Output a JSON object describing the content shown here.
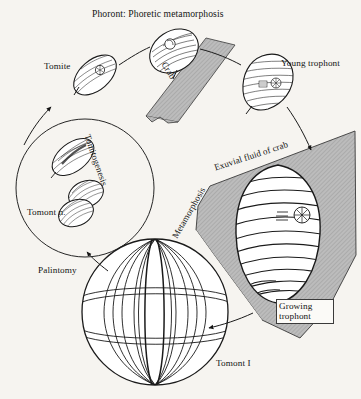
{
  "figure": {
    "kind": "life-cycle-diagram",
    "background_color": "#f6f4f0",
    "ink_color": "#141414",
    "shaded_fill_color": "#b8b8b8",
    "highlight_fill_color": "#ffffff"
  },
  "labels": {
    "title": "Phoront: Phoretic metamorphosis",
    "tomite": "Tomite",
    "crab": "Crab",
    "young_trophont": "Young trophont",
    "exuvial_fluid": "Exuvial fluid of crab",
    "growing_trophont": "Growing trophont",
    "metamorphosis": "Metamorphosis",
    "tomitogenesis": "Tomitogenesis",
    "tomont_n": "Tomont n.",
    "palintomy": "Palintomy",
    "tomont_i": "Tomont I"
  },
  "stages": [
    {
      "id": "tomite",
      "name": "Tomite",
      "shape": "small-lens-ciliate"
    },
    {
      "id": "phoront",
      "name": "Phoront",
      "shape": "ovoid-ciliate"
    },
    {
      "id": "young-trophont",
      "name": "Young trophont",
      "shape": "leaf-ciliate"
    },
    {
      "id": "growing-trophont",
      "name": "Growing trophont",
      "shape": "large-ovoid-ciliate"
    },
    {
      "id": "tomont-i",
      "name": "Tomont I",
      "shape": "large-sphere"
    },
    {
      "id": "tomont-n",
      "name": "Tomont n.",
      "shape": "dividing-doublet"
    }
  ],
  "regions": [
    {
      "id": "crab-strip",
      "name": "Crab",
      "fill": "hatched-gray"
    },
    {
      "id": "exuvial-fluid",
      "name": "Exuvial fluid of crab",
      "fill": "hatched-gray"
    },
    {
      "id": "tomitogenesis-circle",
      "name": "Tomitogenesis",
      "fill": "none"
    }
  ],
  "transitions": [
    {
      "from": "tomite",
      "to": "phoront",
      "label": "Phoront: Phoretic metamorphosis"
    },
    {
      "from": "phoront",
      "to": "young-trophont",
      "label": ""
    },
    {
      "from": "young-trophont",
      "to": "growing-trophont",
      "label": ""
    },
    {
      "from": "growing-trophont",
      "to": "tomont-i",
      "label": "Metamorphosis"
    },
    {
      "from": "tomont-i",
      "to": "tomont-n",
      "label": "Palintomy"
    },
    {
      "from": "tomont-n",
      "to": "tomite",
      "label": "Tomitogenesis"
    }
  ]
}
